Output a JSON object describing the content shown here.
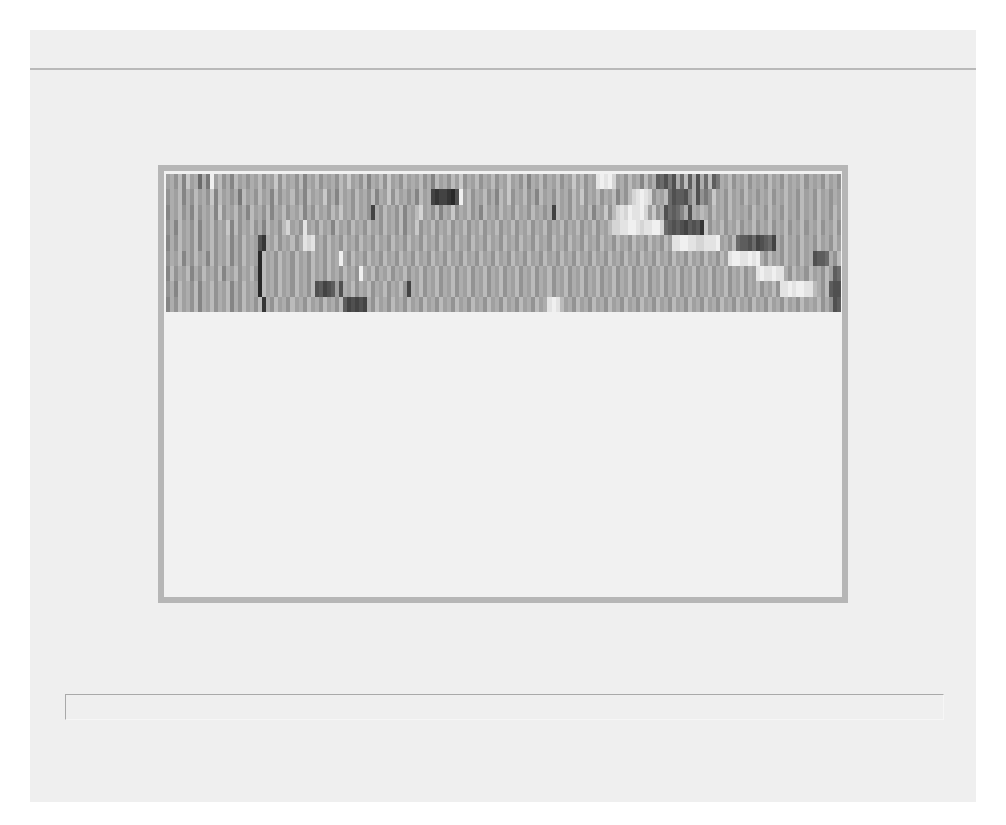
{
  "page": {
    "background": "#ffffff",
    "paper_color": "#efefef",
    "rule_color": "#b9b9b9",
    "frame_color": "#b6b6b6"
  },
  "figure": {
    "caption": ""
  },
  "chart_data": {
    "type": "heatmap",
    "title": "",
    "xlabel": "",
    "ylabel": "",
    "colormap": "grayscale (0 = black, f = white)",
    "rows": 9,
    "columns": 168,
    "grid": false,
    "legend": "none",
    "values_hex": [
      "9a8b7c9a5a6f9b8a7b9a8a9b8a9c8b9a8b7a9b8a9a8b9c9a8b7a9b8c9a8b9a9b8a7b9a8b9c8a9b8a9b8a9c9a8b7a9b8a9b8a9c9b8a9efefd9a8b9a7b8a45363a5b4a3a5b46a9b8a9b8a9a8b9a8b9a9b8a9a8b9a8b9a9b8a9b8a9b8a9a8b9a8",
      "8a9b7a8b9a8c7b9a8a6b9a8b9a7b8a9b8a7b9a9c8a7b9a8b9a8b7a9c8b9a8a7b9a2122103f9b8a9b8a7b9c8a9b8a7b9a8b9a8b9c8a9b8a9b7a8bdefed8a9b534437a3868c9a8b9a8b9a8a9b8a9b9a8b9a8b9a8a9b8a9b8a9b9a8",
      "7a9b8a7b8a9b7c8a9b8a7b9a8b7a9b8a9b7a8b9a8b9c9a8b9a82a8b9a8b7a9bd9a8b7a9c8a9b8a7b9a8b9a8b9a8b9a8a2b9a8b9a8b7a9c8bdedfeefd9c8a35457a3a9ba8b9a8b9a9a8b9a8b9a8b9a8b9a8b9a8b9a8b9a8b9a",
      "8a7b9a8b7a9b8a9c7b8a9b8a7b9a8bd9a8e9a8b9a7b9a8b9a8b9a8b9a8b7a9c8a9b8a9b8a9b8a9b8a9b8a9b8a9b8a9b8a9b8a9b8a9b8a9bddeeffedeeffd5434324341c8a9b8a9b8a9b8a9b8a9b8a9b8a9b8a9b8a9b8a9b",
      "7a8b9a8b7a9b8a9b7a8b9a931a9b8a9b8aede9a8b9a8b9a8b9a8b9a8b9a8b9a8b9a8b9a8b9a8b9a8b9a8b9a8b9a8b9a8b9a8b9a8b9a8b9a8b9a8b9a8b9a8b9eeffeeddeeef9a8b5443523452a8b9a8b9a8b9a8b9a8b9a8b",
      "8a9b7a8b9a7b8a9b7a8b9a90b9a8b9a8b9a8b9a8b9afa8b9a8b9a8b9a8b9a8b9a8b9a8b9a8b9a8b9a8b9a8b9a8b9a8b9a8b9a8b9a8b9a8b9a8b9a8b9a8b9a8b9a8b9a8b9a8b9effeefefa8b9a8b9a8b9a3445a8b9a8b9a8b",
      "7b8a9b7a8b9a8b7a9b8a9b80b9a8b9a8b9a8b9a8b9a8b9a8fa9b8a9b8a9b8a9b8a9b8a9b8a9b8a9b8a9b8a9b8a9b8a9b8a9b8a9b8a9b8a9b8a9b8a9b8a9b8a9b8a9b8a9b8a9b8a9b8a9efeefeea8b9a8b9a8b945332a8b9a8",
      "8a7b9a8b7a9b8a9b7a8b9a90b9a8b9a8b9a8b3423493a9b8a9b8a9b8a9b82a9b8a9b8a9b8a9b8a9b8a9b8a9b8a9b8a9b8a9b8a9b8a9b8a9b8a9b8a9b8a9b8a9b8a9b8a9b8a9b8a9b8a9b8a9b8eefeffeeba8b43342433a8b9",
      "7a8b9a8b7a9b8a9b7a8b9a8b1a8b9a8b9a8b9a8b9a8b423232a8b9a8b9a8b9a8b9a8b9a8b9a8b9a8b9a8b9a8b9a8b9aefeb9a8b9a8b9a8b9a8b9a8b9a8b9a8b9a8b9a8b9a8b9a8b9a8b9a8b9a8b9a8b9a9b8a8343232343a8b"
    ]
  }
}
